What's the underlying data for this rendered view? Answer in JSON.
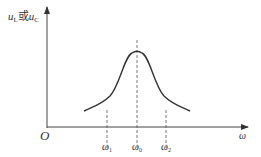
{
  "diagram": {
    "title": "",
    "y_axis_label": {
      "main1": "u",
      "sub1": "L",
      "connector": "或",
      "main2": "u",
      "sub2": "C"
    },
    "x_axis_label": "ω",
    "origin_label": "O",
    "markers": [
      {
        "main": "ω",
        "sub": "1"
      },
      {
        "main": "ω",
        "sub": "0"
      },
      {
        "main": "ω",
        "sub": "2"
      }
    ],
    "curve_description": "resonance curve peaking at ω0",
    "colors": {
      "line": "#333333",
      "dash": "#555555"
    }
  }
}
